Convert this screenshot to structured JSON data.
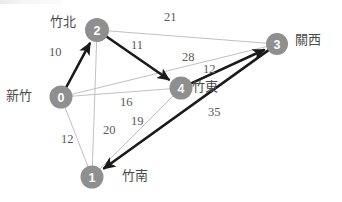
{
  "figure": {
    "type": "weighted-undirected-graph"
  },
  "nodes": [
    {
      "id": "0",
      "label": "0",
      "city": "新竹",
      "cx": 61,
      "cy": 97,
      "r": 11.5,
      "city_x": 6,
      "city_y": 89
    },
    {
      "id": "1",
      "label": "1",
      "city": "竹南",
      "cx": 92,
      "cy": 177,
      "r": 11.5,
      "city_x": 122,
      "city_y": 169
    },
    {
      "id": "2",
      "label": "2",
      "city": "竹北",
      "cx": 97,
      "cy": 30,
      "r": 12.0,
      "city_x": 50,
      "city_y": 15
    },
    {
      "id": "3",
      "label": "3",
      "city": "關西",
      "cx": 277,
      "cy": 44,
      "r": 11.0,
      "city_x": 295,
      "city_y": 33
    },
    {
      "id": "4",
      "label": "4",
      "city": "竹東",
      "cx": 181,
      "cy": 88,
      "r": 11.5,
      "city_x": 192,
      "city_y": 80
    }
  ],
  "edges": [
    {
      "from": "2",
      "to": "3",
      "weight": "21",
      "style": "thin",
      "label_x": 164,
      "label_y": 11
    },
    {
      "from": "0",
      "to": "2",
      "weight": "10",
      "style": "bold",
      "label_x": 49,
      "label_y": 46,
      "arrow": "to"
    },
    {
      "from": "2",
      "to": "4",
      "weight": "11",
      "style": "bold",
      "label_x": 131,
      "label_y": 39,
      "arrow": "to"
    },
    {
      "from": "0",
      "to": "3",
      "weight": "28",
      "style": "thin",
      "label_x": 182,
      "label_y": 51
    },
    {
      "from": "4",
      "to": "3",
      "weight": "12",
      "style": "bold",
      "label_x": 203,
      "label_y": 63,
      "arrow": "to"
    },
    {
      "from": "0",
      "to": "4",
      "weight": "16",
      "style": "thin",
      "label_x": 120,
      "label_y": 96
    },
    {
      "from": "1",
      "to": "4",
      "weight": "19",
      "style": "thin",
      "label_x": 131,
      "label_y": 115
    },
    {
      "from": "2",
      "to": "1",
      "weight": "20",
      "style": "thin",
      "label_x": 103,
      "label_y": 124
    },
    {
      "from": "0",
      "to": "1",
      "weight": "12",
      "style": "thin",
      "label_x": 61,
      "label_y": 133
    },
    {
      "from": "3",
      "to": "1",
      "weight": "35",
      "style": "bold",
      "label_x": 208,
      "label_y": 106,
      "arrow": "to"
    }
  ],
  "colors": {
    "node_fill": "#8f8f8f",
    "node_text": "#ffffff",
    "edge_thin": "#b9b9b9",
    "edge_bold": "#1a1a1a",
    "weight_text": "#595959",
    "city_text": "#4a4a4a",
    "background": "#ffffff"
  }
}
